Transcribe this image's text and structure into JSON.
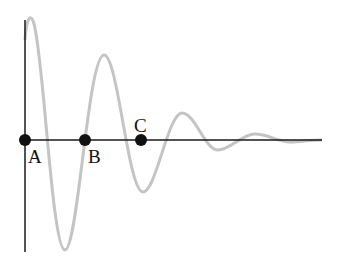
{
  "diagram": {
    "type": "damped-oscillation",
    "colors": {
      "axis": "#1a1a1a",
      "curve": "#c4c4c4",
      "points": "#111111"
    },
    "points": [
      {
        "id": "A",
        "label": "A",
        "x": 25,
        "y": 140,
        "label_x": 28,
        "label_y": 146
      },
      {
        "id": "B",
        "label": "B",
        "x": 85,
        "label_x": 88,
        "y": 140,
        "label_y": 146
      },
      {
        "id": "C",
        "label": "C",
        "x": 141,
        "y": 140,
        "label_x": 134,
        "label_y": 116
      }
    ],
    "curve_extrema": [
      [
        25,
        40
      ],
      [
        28,
        18
      ],
      [
        65,
        250
      ],
      [
        104,
        55
      ],
      [
        143,
        192
      ],
      [
        182,
        113
      ],
      [
        218,
        150
      ],
      [
        255,
        134
      ],
      [
        290,
        142
      ],
      [
        320,
        140
      ]
    ]
  }
}
